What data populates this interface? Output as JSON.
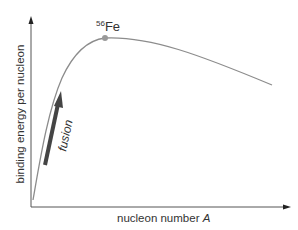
{
  "figure": {
    "y_axis_label": "binding energy per nucleon",
    "x_axis_label": "nucleon number ",
    "x_axis_label_italic": "A",
    "peak_label_sup": "56",
    "peak_label": "Fe",
    "arrow_label": "fusion"
  },
  "colors": {
    "axis": "#555555",
    "curve": "#8c8c8c",
    "peak_dot": "#999999",
    "fusion_arrow": "#444444",
    "text": "#333333"
  }
}
